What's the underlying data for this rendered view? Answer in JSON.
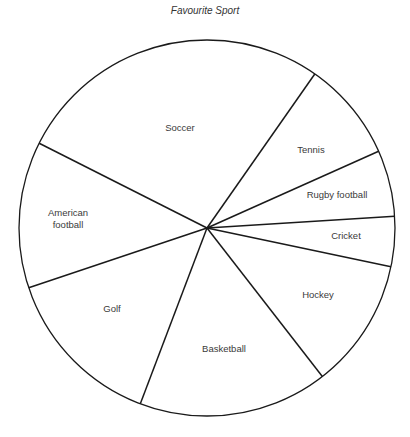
{
  "chart_data": {
    "type": "pie",
    "title": "Favourite Sport",
    "categories": [
      "Soccer",
      "Tennis",
      "Rugby football",
      "Cricket",
      "Hockey",
      "Basketball",
      "Golf",
      "American football"
    ],
    "values": [
      27.3,
      8.6,
      5.7,
      4.3,
      11.2,
      16.3,
      14.1,
      12.6
    ],
    "value_unit": "percent (estimated from slice angles)",
    "start_angle_deg": -153.2,
    "direction": "clockwise",
    "legend": "none (labels inside slices)",
    "colors": {
      "fill": "#ffffff",
      "stroke": "#1a1a1a",
      "label": "#3a3a3a"
    }
  },
  "labels": [
    {
      "text": "Soccer",
      "x": 180,
      "y": 131
    },
    {
      "text": "Tennis",
      "x": 311,
      "y": 153
    },
    {
      "text": "Rugby football",
      "x": 337,
      "y": 198
    },
    {
      "text": "Cricket",
      "x": 346,
      "y": 239
    },
    {
      "text": "Hockey",
      "x": 318,
      "y": 298
    },
    {
      "text": "Basketball",
      "x": 224,
      "y": 352
    },
    {
      "text": "Golf",
      "x": 112,
      "y": 312
    },
    {
      "text": "American",
      "x": 68,
      "y": 216
    },
    {
      "text": "football",
      "x": 68,
      "y": 228
    }
  ]
}
